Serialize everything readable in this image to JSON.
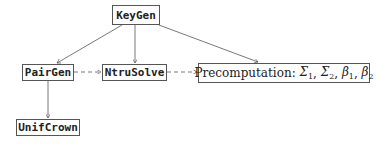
{
  "diagram": {
    "nodes": {
      "keygen": {
        "label": "KeyGen"
      },
      "pairgen": {
        "label": "PairGen"
      },
      "ntrusolve": {
        "label": "NtruSolve"
      },
      "unifcrown": {
        "label": "UnifCrown"
      },
      "precomputation": {
        "prefix": "Precomputation: ",
        "terms": [
          {
            "sym": "Σ",
            "sub": "1"
          },
          {
            "sym": "Σ",
            "sub": "2"
          },
          {
            "sym": "β",
            "sub": "1"
          },
          {
            "sym": "β",
            "sub": "2"
          }
        ]
      }
    },
    "edges": [
      {
        "from": "KeyGen",
        "to": "PairGen",
        "style": "solid"
      },
      {
        "from": "KeyGen",
        "to": "NtruSolve",
        "style": "solid"
      },
      {
        "from": "KeyGen",
        "to": "Precomputation",
        "style": "solid"
      },
      {
        "from": "PairGen",
        "to": "NtruSolve",
        "style": "dashed"
      },
      {
        "from": "NtruSolve",
        "to": "Precomputation",
        "style": "dashed"
      },
      {
        "from": "PairGen",
        "to": "UnifCrown",
        "style": "solid"
      }
    ],
    "colors": {
      "line": "#555555",
      "text": "#222222",
      "background": "#ffffff"
    }
  }
}
